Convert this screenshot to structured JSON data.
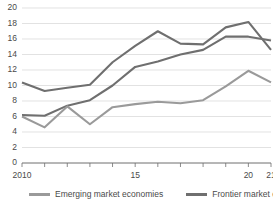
{
  "chart_data": {
    "type": "line",
    "title": "",
    "xlabel": "",
    "ylabel": "",
    "ylim": [
      0,
      20
    ],
    "ytick_step": 2,
    "grid": true,
    "legend_position": "bottom",
    "x": [
      2010,
      2011,
      2012,
      2013,
      2014,
      2015,
      2016,
      2017,
      2018,
      2019,
      2020,
      2021
    ],
    "xtick_labels": [
      "2010",
      "",
      "",
      "",
      "",
      "15",
      "",
      "",
      "",
      "",
      "20",
      "21"
    ],
    "ytick_labels": [
      "0",
      "2",
      "4",
      "6",
      "8",
      "10",
      "12",
      "14",
      "16",
      "18",
      "20"
    ],
    "series": [
      {
        "name": "Frontier market economies",
        "color": "#6f6f6f",
        "values": [
          10.4,
          9.3,
          9.7,
          10.1,
          13.0,
          15.1,
          17.0,
          15.4,
          15.3,
          17.5,
          18.2,
          14.6
        ]
      },
      {
        "name": "Emerging market economies",
        "color": "#6f6f6f",
        "values": [
          6.2,
          6.1,
          7.4,
          8.1,
          10.0,
          12.4,
          13.1,
          14.0,
          14.6,
          16.3,
          16.3,
          15.8
        ]
      },
      {
        "name": "Emerging market economies (lower)",
        "color": "#9a9a9a",
        "values": [
          6.0,
          4.6,
          7.3,
          5.0,
          7.2,
          7.6,
          7.9,
          7.7,
          8.1,
          9.9,
          11.9,
          10.4
        ]
      }
    ]
  },
  "legend": {
    "entries": [
      {
        "label": "Emerging market economies",
        "color": "#9a9a9a"
      },
      {
        "label": "Frontier market economies",
        "color": "#6f6f6f"
      }
    ]
  },
  "colors": {
    "gridline": "#d5d5d5",
    "axis": "#6e6e6e",
    "text": "#4a4a4a",
    "background": "#ffffff"
  }
}
